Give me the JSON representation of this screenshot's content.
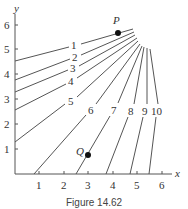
{
  "figure": {
    "caption": "Figure 14.62",
    "x_axis_label": "x",
    "y_axis_label": "y",
    "x_ticks": [
      "1",
      "2",
      "3",
      "4",
      "5",
      "6"
    ],
    "y_ticks": [
      "1",
      "2",
      "3",
      "4",
      "5",
      "6"
    ],
    "points": [
      {
        "label": "P",
        "x": 4.2,
        "y": 5.7
      },
      {
        "label": "Q",
        "x": 3.0,
        "y": 0.77
      }
    ],
    "contour_labels": [
      "1",
      "2",
      "3",
      "4",
      "5",
      "6",
      "7",
      "8",
      "9",
      "10"
    ]
  }
}
